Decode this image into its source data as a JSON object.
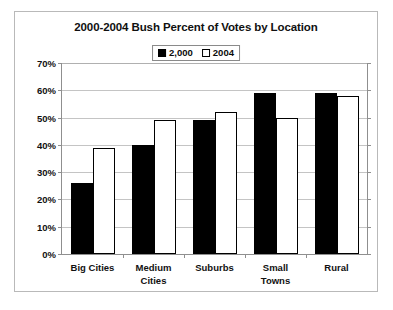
{
  "chart_data": {
    "type": "bar",
    "title": "2000-2004 Bush Percent of Votes by Location",
    "xlabel": "",
    "ylabel": "",
    "ylim": [
      0,
      70
    ],
    "ytick_step": 10,
    "ytick_labels": [
      "0%",
      "10%",
      "20%",
      "30%",
      "40%",
      "50%",
      "60%",
      "70%"
    ],
    "grid": true,
    "legend_position": "top-center",
    "categories": [
      "Big  Cities",
      "Medium Cities",
      "Suburbs",
      "Small Towns",
      "Rural"
    ],
    "series": [
      {
        "name": "2,000",
        "color": "#000000",
        "values": [
          26,
          40,
          49,
          59,
          59
        ]
      },
      {
        "name": "2004",
        "color": "#ffffff",
        "values": [
          39,
          49,
          52,
          50,
          58
        ]
      }
    ]
  },
  "category_lines": [
    [
      "Big  Cities"
    ],
    [
      "Medium",
      "Cities"
    ],
    [
      "Suburbs"
    ],
    [
      "Small",
      "Towns"
    ],
    [
      "Rural"
    ]
  ],
  "colors": {
    "series_2000": "#000000",
    "series_2004": "#ffffff",
    "outline": "#000000",
    "grid": "#c4c4c4",
    "axis": "#8f8f8f",
    "frame": "#b9b9b9",
    "text": "#111111",
    "background": "#ffffff"
  }
}
